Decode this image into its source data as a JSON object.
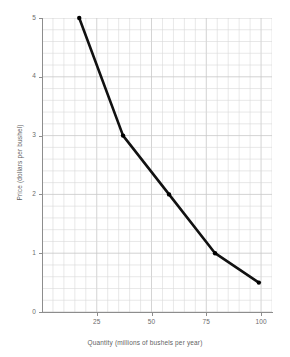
{
  "chart_data": {
    "type": "line",
    "title": "",
    "xlabel": "Quantity (millions of bushels per year)",
    "ylabel": "Price (dollars per bushel)",
    "xlim": [
      0,
      105
    ],
    "ylim": [
      0,
      5
    ],
    "grid": true,
    "legend": "none",
    "xticks": [
      25,
      50,
      75,
      100
    ],
    "xtick_labels": [
      "25",
      "50",
      "75",
      "100"
    ],
    "yticks": [
      0,
      1,
      2,
      3,
      4,
      5
    ],
    "ytick_labels": [
      "0",
      "1",
      "2",
      "3",
      "4",
      "5"
    ],
    "x": [
      17,
      37,
      58,
      79,
      99
    ],
    "y": [
      5,
      3,
      2,
      1,
      0.5
    ],
    "series": [
      {
        "name": "Demand",
        "points": [
          {
            "quantity": 17,
            "price": 5
          },
          {
            "quantity": 37,
            "price": 3
          },
          {
            "quantity": 58,
            "price": 2
          },
          {
            "quantity": 79,
            "price": 1
          },
          {
            "quantity": 99,
            "price": 0.5
          }
        ]
      }
    ],
    "line_color": "#111111",
    "marker_color": "#000000",
    "grid_color": "#d9d9d9",
    "axis_color": "#8d8d8d"
  }
}
